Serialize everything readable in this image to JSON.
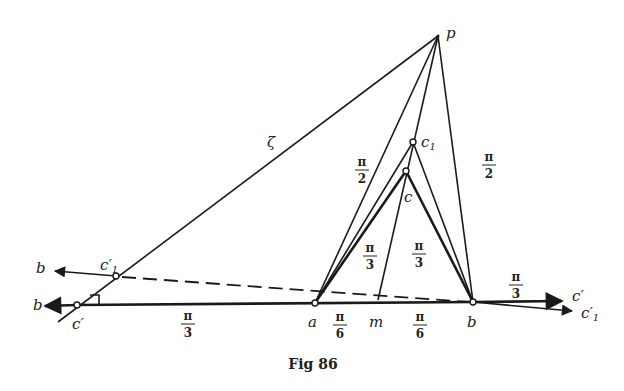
{
  "figure": {
    "caption": "Fig 86",
    "points": {
      "p": {
        "label": "p",
        "x": 438,
        "y": 36
      },
      "c1": {
        "label": "c",
        "sub": "1",
        "x": 413,
        "y": 142
      },
      "c": {
        "label": "c",
        "x": 406,
        "y": 171
      },
      "a": {
        "label": "a",
        "x": 315,
        "y": 303
      },
      "m": {
        "label": "m",
        "x": 378,
        "y": 300
      },
      "b": {
        "label": "b",
        "x": 473,
        "y": 302
      },
      "c_prime": {
        "label": "c′",
        "x": 77,
        "y": 305
      },
      "c1_prime": {
        "label": "c′",
        "sub": "1",
        "x": 116,
        "y": 276
      }
    },
    "line_labels": {
      "zeta": "ζ",
      "b_left_upper": "b",
      "b_left_lower": "b",
      "c_prime_right": "c′",
      "c1_prime_right": "c′",
      "c1_prime_right_sub": "1"
    },
    "angles": [
      {
        "num": "π",
        "den": "2",
        "where": "left of p-c1"
      },
      {
        "num": "π",
        "den": "2",
        "where": "right of p-b"
      },
      {
        "num": "π",
        "den": "3",
        "where": "left of c-m"
      },
      {
        "num": "π",
        "den": "3",
        "where": "right of c-m"
      },
      {
        "num": "π",
        "den": "3",
        "where": "right of b"
      },
      {
        "num": "π",
        "den": "3",
        "where": "below c'-a"
      },
      {
        "num": "π",
        "den": "6",
        "where": "between a and m"
      },
      {
        "num": "π",
        "den": "6",
        "where": "between m and b"
      }
    ]
  }
}
